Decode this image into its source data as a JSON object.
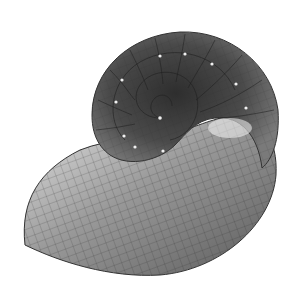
{
  "image": {
    "subject": "Nautilus shell 3D wireframe render",
    "alt": "Shaded nautilus shell surface with grid mesh lines and spiral septa"
  },
  "colors": {
    "background": "#ffffff",
    "shell_dark": "#3a3a3a",
    "shell_mid": "#6e6e6e",
    "shell_light": "#d9d9d9",
    "grid_line": "#2a2a2a",
    "highlight": "#f2f2f2"
  }
}
